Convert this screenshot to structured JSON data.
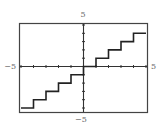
{
  "chart_data": {
    "type": "line",
    "title": "",
    "xlabel": "",
    "ylabel": "",
    "xlim": [
      -5,
      5
    ],
    "ylim": [
      -5,
      5
    ],
    "grid": false,
    "x_tick_step": 1,
    "y_tick_step": 1,
    "tick_labels": {
      "x_min": "−5",
      "x_max": "5",
      "y_min": "−5",
      "y_max": "5"
    },
    "series": [
      {
        "name": "f(x)",
        "segments": [
          {
            "x": [
              -5,
              -4
            ],
            "y": -5
          },
          {
            "x": [
              -4,
              -3
            ],
            "y": -4
          },
          {
            "x": [
              -3,
              -2
            ],
            "y": -3
          },
          {
            "x": [
              -2,
              -1
            ],
            "y": -2
          },
          {
            "x": [
              -1,
              0
            ],
            "y": -1
          },
          {
            "x": [
              0,
              1
            ],
            "y": 0
          },
          {
            "x": [
              1,
              2
            ],
            "y": 1
          },
          {
            "x": [
              2,
              3
            ],
            "y": 2
          },
          {
            "x": [
              3,
              4
            ],
            "y": 3
          },
          {
            "x": [
              4,
              5
            ],
            "y": 4
          }
        ]
      }
    ],
    "line_color": "#222222",
    "axis_color": "#333333",
    "frame_color": "#444444"
  }
}
